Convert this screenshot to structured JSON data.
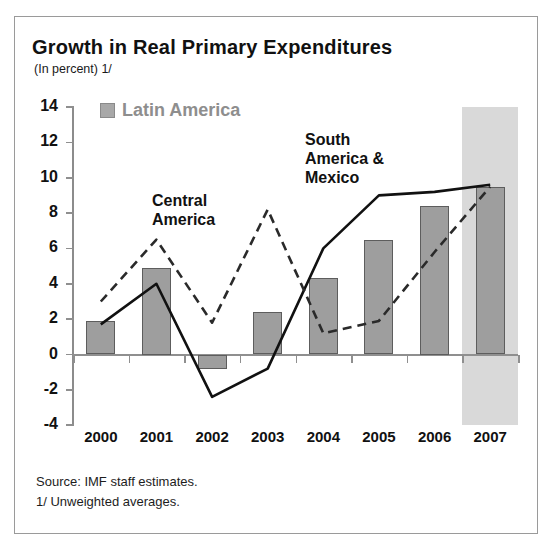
{
  "figure": {
    "title": "Growth in Real Primary Expenditures",
    "subtitle": "(In percent) 1/",
    "notes": [
      "Source: IMF staff estimates.",
      "1/ Unweighted averages."
    ],
    "colors": {
      "bar_fill": "#9e9e9e",
      "bar_edge": "#5d5d5d",
      "axis": "#8f8f8f",
      "line_solid": "#111111",
      "line_dashed": "#2a2a2a",
      "shaded_band": "#d9d9d9",
      "legend_text": "#8e8e8e"
    }
  },
  "chart_data": {
    "type": "bar",
    "title": "Growth in Real Primary Expenditures",
    "subtitle": "(In percent) 1/",
    "xlabel": "",
    "ylabel": "",
    "ylim": [
      -4,
      14
    ],
    "yticks": [
      14,
      12,
      10,
      8,
      6,
      4,
      2,
      0,
      -2,
      -4
    ],
    "grid": false,
    "legend_position": "top-left",
    "categories": [
      "2000",
      "2001",
      "2002",
      "2003",
      "2004",
      "2005",
      "2006",
      "2007"
    ],
    "series": [
      {
        "name": "Latin America",
        "render": "bar",
        "values": [
          1.9,
          4.9,
          -0.8,
          2.4,
          4.3,
          6.5,
          8.4,
          9.5
        ]
      },
      {
        "name": "Central America",
        "render": "dashed-line",
        "values": [
          3.0,
          6.5,
          1.8,
          8.2,
          1.2,
          1.9,
          5.8,
          9.5
        ]
      },
      {
        "name": "South America & Mexico",
        "render": "solid-line",
        "values": [
          1.7,
          4.0,
          -2.4,
          -0.8,
          6.0,
          9.0,
          9.2,
          9.6
        ]
      }
    ],
    "annotations": [
      {
        "text": "Central\nAmerica",
        "near_category": "2001"
      },
      {
        "text": "South\nAmerica &\nMexico",
        "near_category": "2004"
      }
    ],
    "shaded_region": {
      "from": "2007",
      "label": "projection",
      "color": "#d9d9d9"
    }
  },
  "legend": {
    "entries": [
      {
        "label": "Latin America",
        "swatch": "gray-square"
      }
    ]
  },
  "annotations": {
    "central": {
      "line1": "Central",
      "line2": "America"
    },
    "south": {
      "line1": "South",
      "line2": "America &",
      "line3": "Mexico"
    }
  },
  "axis": {
    "y_labels": [
      "14",
      "12",
      "10",
      "8",
      "6",
      "4",
      "2",
      "0",
      "-2",
      "-4"
    ],
    "x_labels": [
      "2000",
      "2001",
      "2002",
      "2003",
      "2004",
      "2005",
      "2006",
      "2007"
    ]
  }
}
